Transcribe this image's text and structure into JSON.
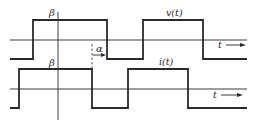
{
  "diagram": {
    "type": "waveform-timing-diagram",
    "colors": {
      "line": "#2a2a2a",
      "axis": "#3a3a3a",
      "background": "#ffffff"
    },
    "labels": {
      "beta_top": "β",
      "beta_bottom": "β",
      "alpha": "α",
      "v_label": "v(t)",
      "i_label": "i(t)",
      "t_top": "t",
      "t_bottom": "t"
    },
    "waveforms": [
      {
        "name": "v(t)",
        "baseline_y": 40,
        "high_y": 20,
        "low_y": 59,
        "transitions_x": [
          33,
          107,
          143,
          203
        ],
        "start_state": "low",
        "x_range": [
          10,
          247
        ]
      },
      {
        "name": "i(t)",
        "baseline_y": 89,
        "high_y": 69,
        "low_y": 108,
        "transitions_x": [
          19,
          92,
          128,
          188
        ],
        "start_state": "low",
        "x_range": [
          10,
          247
        ]
      }
    ],
    "vertical_axis": {
      "x": 58,
      "y_range": [
        12,
        120
      ]
    },
    "phase_marker": {
      "label": "α",
      "from_x": 92,
      "to_x": 107,
      "dashed_line_x": 92
    },
    "pulse_width_label": "β"
  }
}
